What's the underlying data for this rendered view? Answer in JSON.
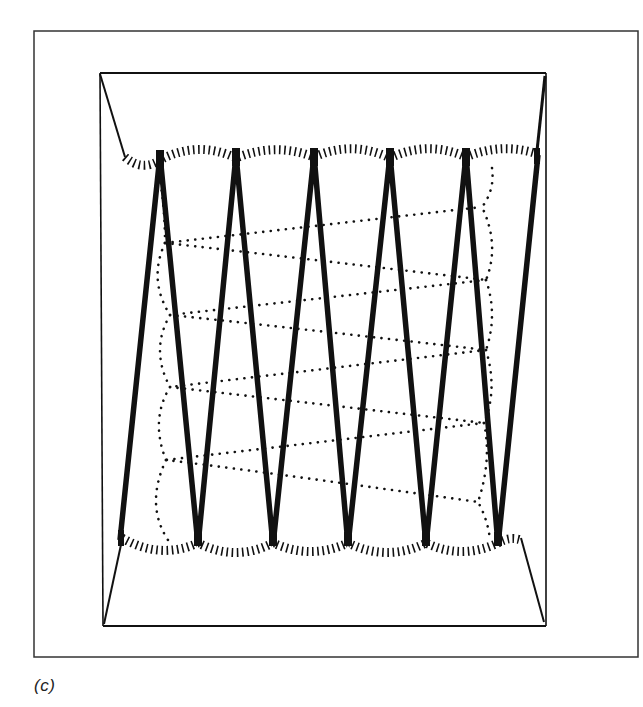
{
  "figure": {
    "caption": "(c)",
    "colors": {
      "ink": "#111111",
      "frame": "#333333",
      "background": "#ffffff"
    },
    "outer_frame": {
      "x1": 34,
      "y1": 31,
      "x2": 638,
      "y2": 657
    },
    "inner_frame": {
      "x1": 100,
      "y1": 73,
      "x2": 546,
      "y2": 626
    },
    "top_edge_y": 155,
    "bottom_edge_y": 545,
    "zigzag_top_apexes_x": [
      160,
      236,
      314,
      390,
      466
    ],
    "zigzag_bottom_apexes_x": [
      198,
      273,
      348,
      426,
      498
    ],
    "zigzag_left_end": {
      "x": 120,
      "y": 540
    },
    "zigzag_right_end": {
      "x": 538,
      "y": 155
    },
    "dotted_path": {
      "left_turns": [
        {
          "x": 165,
          "y": 243
        },
        {
          "x": 170,
          "y": 315
        },
        {
          "x": 170,
          "y": 387
        },
        {
          "x": 166,
          "y": 460
        }
      ],
      "right_turns": [
        {
          "x": 482,
          "y": 207
        },
        {
          "x": 486,
          "y": 280
        },
        {
          "x": 486,
          "y": 350
        },
        {
          "x": 484,
          "y": 423
        },
        {
          "x": 478,
          "y": 502
        }
      ]
    }
  }
}
